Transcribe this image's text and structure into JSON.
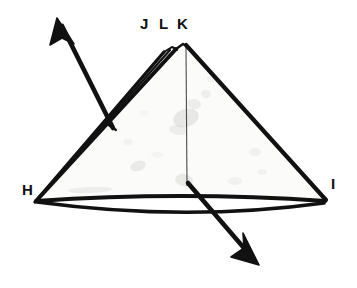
{
  "figure": {
    "kind": "hand-drawn-paper-folding-diagram",
    "background_color": "#ffffff",
    "ink_color": "#111111",
    "paper_fill_color": "#fbfbfa",
    "thin_line_color": "#4a4a4a",
    "smudge_color": "#b9b9b5"
  },
  "labels": [
    {
      "id": "J",
      "text": "J",
      "x": 140,
      "y": 16
    },
    {
      "id": "L",
      "text": "L",
      "x": 159,
      "y": 16
    },
    {
      "id": "K",
      "text": "K",
      "x": 177,
      "y": 16
    },
    {
      "id": "H",
      "text": "H",
      "x": 22,
      "y": 182
    },
    {
      "id": "I",
      "text": "I",
      "x": 331,
      "y": 176
    }
  ],
  "geometry": {
    "apex_K": {
      "x": 186,
      "y": 45
    },
    "apex_L": {
      "x": 176,
      "y": 47
    },
    "apex_J": {
      "x": 167,
      "y": 49
    },
    "corner_H": {
      "x": 36,
      "y": 200
    },
    "corner_I": {
      "x": 325,
      "y": 200
    },
    "center_crease_bottom": {
      "x": 187,
      "y": 186
    }
  },
  "arrows": [
    {
      "name": "fold-open-arrow-upper-left",
      "direction": "up-left",
      "from": {
        "x": 112,
        "y": 127
      },
      "to": {
        "x": 58,
        "y": 21
      }
    },
    {
      "name": "fold-open-arrow-lower-right",
      "direction": "down-right",
      "from": {
        "x": 189,
        "y": 184
      },
      "to": {
        "x": 257,
        "y": 263
      }
    }
  ],
  "smudges": [
    {
      "x": 186,
      "y": 118,
      "rx": 13,
      "ry": 9,
      "o": 0.3,
      "rot": -18
    },
    {
      "x": 194,
      "y": 104,
      "rx": 7,
      "ry": 5,
      "o": 0.22,
      "rot": 12
    },
    {
      "x": 206,
      "y": 94,
      "rx": 5,
      "ry": 4,
      "o": 0.18,
      "rot": 0
    },
    {
      "x": 178,
      "y": 130,
      "rx": 9,
      "ry": 5,
      "o": 0.2,
      "rot": 8
    },
    {
      "x": 138,
      "y": 166,
      "rx": 8,
      "ry": 5,
      "o": 0.25,
      "rot": -20
    },
    {
      "x": 184,
      "y": 180,
      "rx": 9,
      "ry": 6,
      "o": 0.28,
      "rot": 10
    },
    {
      "x": 90,
      "y": 190,
      "rx": 22,
      "ry": 3,
      "o": 0.22,
      "rot": -2
    },
    {
      "x": 255,
      "y": 152,
      "rx": 6,
      "ry": 4,
      "o": 0.14,
      "rot": 0
    },
    {
      "x": 262,
      "y": 172,
      "rx": 5,
      "ry": 3,
      "o": 0.12,
      "rot": 0
    },
    {
      "x": 235,
      "y": 181,
      "rx": 7,
      "ry": 4,
      "o": 0.14,
      "rot": 0
    },
    {
      "x": 128,
      "y": 142,
      "rx": 5,
      "ry": 3,
      "o": 0.13,
      "rot": 0
    },
    {
      "x": 157,
      "y": 155,
      "rx": 6,
      "ry": 3,
      "o": 0.1,
      "rot": 0
    },
    {
      "x": 211,
      "y": 79,
      "rx": 4,
      "ry": 3,
      "o": 0.12,
      "rot": 0
    },
    {
      "x": 144,
      "y": 113,
      "rx": 4,
      "ry": 3,
      "o": 0.1,
      "rot": 0
    }
  ]
}
